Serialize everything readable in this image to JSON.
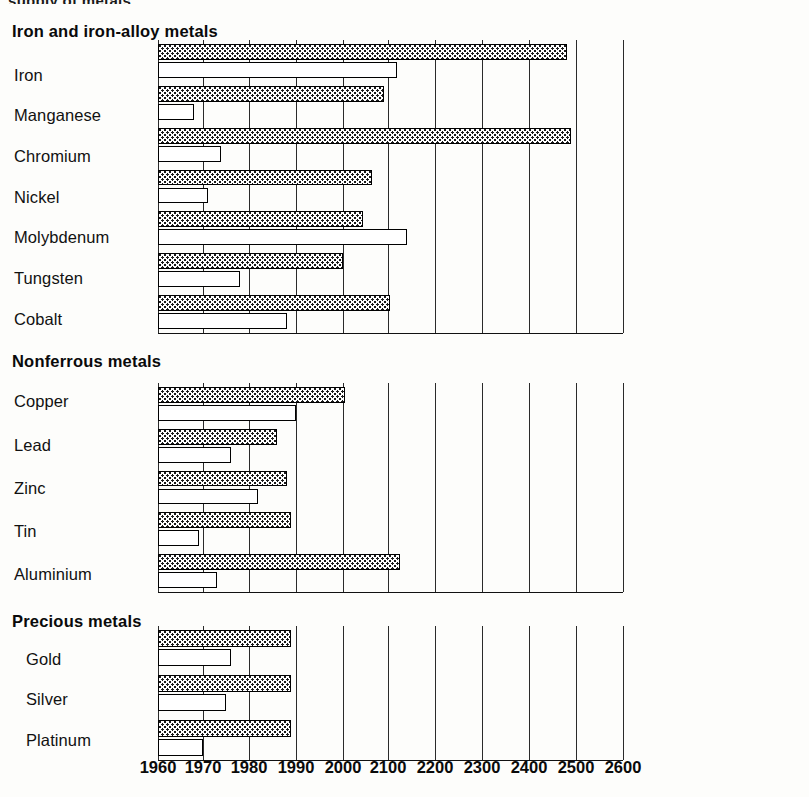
{
  "top_cropped_text": "supply of metals",
  "chart_data": {
    "type": "bar",
    "orientation": "horizontal",
    "title": "",
    "xlabel": "",
    "ylabel": "",
    "grid": true,
    "legend_position": "none",
    "axis_ticks": [
      "1960",
      "1970",
      "1980",
      "1990",
      "2000",
      "2100",
      "2200",
      "2300",
      "2400",
      "2500",
      "2600"
    ],
    "axis_note": "Scale is piecewise: decades from 1960 to 1990, then centuries from 1990 to 2600",
    "series": [
      {
        "name": "upper-stippled-bar",
        "pattern": "stippled"
      },
      {
        "name": "lower-hollow-bar",
        "pattern": "hollow"
      }
    ],
    "sections": [
      {
        "title": "Iron and iron-alloy metals",
        "rows": [
          {
            "label": "Iron",
            "stippled": 2480,
            "hollow": 2120
          },
          {
            "label": "Manganese",
            "stippled": 2090,
            "hollow": 1968
          },
          {
            "label": "Chromium",
            "stippled": 2490,
            "hollow": 1974
          },
          {
            "label": "Nickel",
            "stippled": 2065,
            "hollow": 1971
          },
          {
            "label": "Molybdenum",
            "stippled": 2045,
            "hollow": 2140
          },
          {
            "label": "Tungsten",
            "stippled": 2000,
            "hollow": 1978
          },
          {
            "label": "Cobalt",
            "stippled": 2105,
            "hollow": 1988
          }
        ]
      },
      {
        "title": "Nonferrous metals",
        "rows": [
          {
            "label": "Copper",
            "stippled": 2005,
            "hollow": 1990
          },
          {
            "label": "Lead",
            "stippled": 1986,
            "hollow": 1976
          },
          {
            "label": "Zinc",
            "stippled": 1988,
            "hollow": 1982
          },
          {
            "label": "Tin",
            "stippled": 1989,
            "hollow": 1969
          },
          {
            "label": "Aluminium",
            "stippled": 2125,
            "hollow": 1973
          }
        ]
      },
      {
        "title": "Precious metals",
        "rows": [
          {
            "label": "Gold",
            "stippled": 1989,
            "hollow": 1976
          },
          {
            "label": "Silver",
            "stippled": 1989,
            "hollow": 1975
          },
          {
            "label": "Platinum",
            "stippled": 1989,
            "hollow": 1970
          }
        ]
      }
    ]
  },
  "colors": {
    "ink": "#0a0a0a",
    "paper": "#fdfdfb",
    "grid": "#2a2a2a"
  }
}
